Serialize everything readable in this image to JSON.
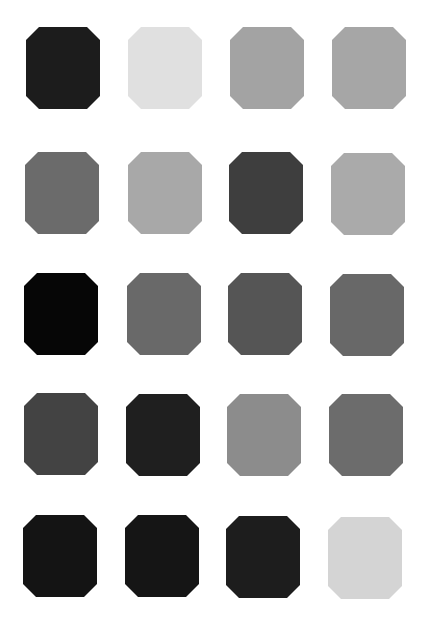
{
  "grid": {
    "rows": 5,
    "columns": 4,
    "shape": "octagon",
    "swatch_size": {
      "width": 74,
      "height": 82
    },
    "background": "#ffffff"
  },
  "swatches": [
    {
      "row": 1,
      "col": 1,
      "x": 26,
      "y": 27,
      "color": "#1c1c1c"
    },
    {
      "row": 1,
      "col": 2,
      "x": 128,
      "y": 27,
      "color": "#e0e0e0"
    },
    {
      "row": 1,
      "col": 3,
      "x": 230,
      "y": 27,
      "color": "#a3a3a3"
    },
    {
      "row": 1,
      "col": 4,
      "x": 332,
      "y": 27,
      "color": "#a6a6a6"
    },
    {
      "row": 2,
      "col": 1,
      "x": 25,
      "y": 152,
      "color": "#6b6b6b"
    },
    {
      "row": 2,
      "col": 2,
      "x": 128,
      "y": 152,
      "color": "#a8a8a8"
    },
    {
      "row": 2,
      "col": 3,
      "x": 229,
      "y": 152,
      "color": "#3e3e3e"
    },
    {
      "row": 2,
      "col": 4,
      "x": 331,
      "y": 153,
      "color": "#aaaaaa"
    },
    {
      "row": 3,
      "col": 1,
      "x": 24,
      "y": 273,
      "color": "#060606"
    },
    {
      "row": 3,
      "col": 2,
      "x": 127,
      "y": 273,
      "color": "#696969"
    },
    {
      "row": 3,
      "col": 3,
      "x": 228,
      "y": 273,
      "color": "#555555"
    },
    {
      "row": 3,
      "col": 4,
      "x": 330,
      "y": 274,
      "color": "#686868"
    },
    {
      "row": 4,
      "col": 1,
      "x": 24,
      "y": 393,
      "color": "#434343"
    },
    {
      "row": 4,
      "col": 2,
      "x": 126,
      "y": 394,
      "color": "#1f1f1f"
    },
    {
      "row": 4,
      "col": 3,
      "x": 227,
      "y": 394,
      "color": "#8c8c8c"
    },
    {
      "row": 4,
      "col": 4,
      "x": 329,
      "y": 394,
      "color": "#6c6c6c"
    },
    {
      "row": 5,
      "col": 1,
      "x": 23,
      "y": 515,
      "color": "#141414"
    },
    {
      "row": 5,
      "col": 2,
      "x": 125,
      "y": 515,
      "color": "#151515"
    },
    {
      "row": 5,
      "col": 3,
      "x": 226,
      "y": 516,
      "color": "#1d1d1d"
    },
    {
      "row": 5,
      "col": 4,
      "x": 328,
      "y": 517,
      "color": "#d4d4d4"
    }
  ]
}
